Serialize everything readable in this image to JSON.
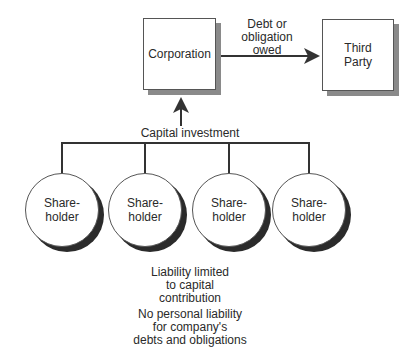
{
  "diagram": {
    "corporation": {
      "label_line1": "Corporation"
    },
    "third_party": {
      "label_line1": "Third",
      "label_line2": "Party"
    },
    "debt_label": {
      "line1": "Debt or",
      "line2": "obligation",
      "line3": "owed"
    },
    "capital_label": "Capital investment",
    "shareholders": [
      {
        "line1": "Share-",
        "line2": "holder"
      },
      {
        "line1": "Share-",
        "line2": "holder"
      },
      {
        "line1": "Share-",
        "line2": "holder"
      },
      {
        "line1": "Share-",
        "line2": "holder"
      }
    ],
    "notes": {
      "liability": {
        "line1": "Liability limited",
        "line2": "to capital",
        "line3": "contribution"
      },
      "personal": {
        "line1": "No personal liability",
        "line2": "for company's",
        "line3": "debts and obligations"
      }
    }
  }
}
